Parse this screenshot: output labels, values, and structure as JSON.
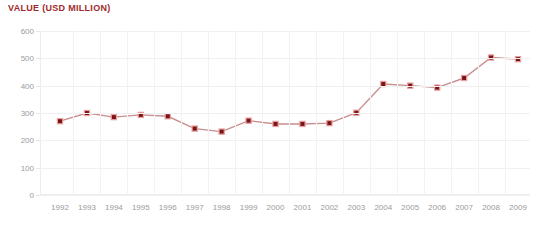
{
  "chart_data": {
    "type": "line",
    "title": "VALUE (USD MILLION)",
    "xlabel": "",
    "ylabel": "",
    "categories": [
      "1992",
      "1993",
      "1994",
      "1995",
      "1996",
      "1997",
      "1998",
      "1999",
      "2000",
      "2001",
      "2002",
      "2003",
      "2004",
      "2005",
      "2006",
      "2007",
      "2008",
      "2009"
    ],
    "values": [
      270,
      300,
      285,
      293,
      288,
      243,
      232,
      272,
      260,
      260,
      263,
      301,
      406,
      400,
      393,
      428,
      503,
      497
    ],
    "ylim": [
      0,
      600
    ],
    "yticks": [
      0,
      100,
      200,
      300,
      400,
      500,
      600
    ],
    "ytick_labels": [
      "0",
      "100",
      "200",
      "300",
      "400",
      "500",
      "600"
    ],
    "grid": "both-light",
    "legend": "none",
    "series_name": "Value (USD Million)",
    "colors": {
      "title": "#9e2a2b",
      "marker": "#7b1416",
      "marker_halo": "#e8a0a0",
      "line": "#c98f8f",
      "grid": "#f0f0f0",
      "tick_text": "#9b9b9b",
      "background": "#ffffff"
    }
  }
}
